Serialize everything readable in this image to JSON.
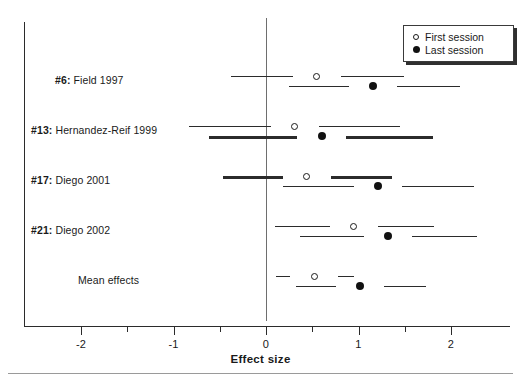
{
  "chart_data": {
    "type": "scatter",
    "subtype": "forest-plot",
    "title": "",
    "xlabel": "Effect size",
    "ylabel": "",
    "xlim": [
      -2.5,
      2.5
    ],
    "xticks": [
      -2,
      -1,
      0,
      1,
      2
    ],
    "xtick_labels": [
      "-2",
      "-1",
      "0",
      "1",
      "2"
    ],
    "minor_xticks": [
      -1.5,
      -0.5,
      0.5,
      1.5
    ],
    "grid": false,
    "reference_line": 0,
    "legend": {
      "position": "top-right",
      "entries": [
        {
          "label": "First session",
          "marker": "open-circle"
        },
        {
          "label": "Last session",
          "marker": "filled-circle"
        }
      ]
    },
    "categories": [
      "#6: Field 1997",
      "#13: Hernandez-Reif 1999",
      "#17: Diego 2001",
      "#21: Diego 2002",
      "Mean effects"
    ],
    "series": [
      {
        "name": "First session",
        "marker": "open-circle",
        "values": [
          0.55,
          0.31,
          0.44,
          0.95,
          0.52
        ],
        "ci_low": [
          -0.38,
          -0.83,
          -0.47,
          0.1,
          0.11
        ],
        "ci_high": [
          1.49,
          1.45,
          1.36,
          1.82,
          0.95
        ],
        "line_weight": [
          "thin",
          "thin",
          "thick",
          "thin",
          "thin"
        ]
      },
      {
        "name": "Last session",
        "marker": "filled-circle",
        "values": [
          1.16,
          0.6,
          1.21,
          1.32,
          1.02
        ],
        "ci_low": [
          0.25,
          -0.62,
          0.18,
          0.37,
          0.32
        ],
        "ci_high": [
          2.1,
          1.8,
          2.25,
          2.28,
          1.73
        ],
        "line_weight": [
          "thin",
          "thick",
          "thin",
          "thin",
          "thin"
        ]
      }
    ]
  },
  "rows": [
    {
      "id": "#6:",
      "label": "Field 1997"
    },
    {
      "id": "#13:",
      "label": "Hernandez-Reif 1999"
    },
    {
      "id": "#17:",
      "label": "Diego 2001"
    },
    {
      "id": "#21:",
      "label": "Diego 2002"
    },
    {
      "id": "",
      "label": "Mean effects"
    }
  ],
  "axis": {
    "title": "Effect size",
    "tick_labels": [
      "-2",
      "-1",
      "0",
      "1",
      "2"
    ]
  },
  "legend": {
    "first_session": "First session",
    "last_session": "Last session"
  },
  "colors": {
    "ink": "#1a1a1a",
    "line": "#2b2b2b",
    "zero_line": "#6e6e6e",
    "marker_fill": "#111111",
    "background": "#ffffff"
  }
}
